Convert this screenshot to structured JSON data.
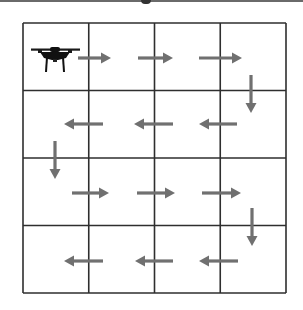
{
  "diagram": {
    "title": "",
    "type": "grid-path",
    "grid": {
      "rows": 4,
      "cols": 4,
      "x0": 23,
      "y0": 23,
      "x1": 286,
      "y1": 293,
      "line_color": "#2e2e2e"
    },
    "agent": {
      "icon": "drone-icon",
      "cell": [
        0,
        0
      ],
      "color": "#1a1a1a"
    },
    "arrow_color": "#707070",
    "path": [
      {
        "id": "r1-a1",
        "dir": "right",
        "x1": 78,
        "y1": 58,
        "x2": 111,
        "y2": 58
      },
      {
        "id": "r1-a2",
        "dir": "right",
        "x1": 138,
        "y1": 58,
        "x2": 173,
        "y2": 58
      },
      {
        "id": "r1-a3",
        "dir": "right",
        "x1": 199,
        "y1": 58,
        "x2": 242,
        "y2": 58
      },
      {
        "id": "d1",
        "dir": "down",
        "x1": 251,
        "y1": 75,
        "x2": 251,
        "y2": 113
      },
      {
        "id": "r2-a1",
        "dir": "left",
        "x1": 237,
        "y1": 124,
        "x2": 199,
        "y2": 124
      },
      {
        "id": "r2-a2",
        "dir": "left",
        "x1": 173,
        "y1": 124,
        "x2": 134,
        "y2": 124
      },
      {
        "id": "r2-a3",
        "dir": "left",
        "x1": 103,
        "y1": 124,
        "x2": 64,
        "y2": 124
      },
      {
        "id": "d2",
        "dir": "down",
        "x1": 55,
        "y1": 141,
        "x2": 55,
        "y2": 179
      },
      {
        "id": "r3-a1",
        "dir": "right",
        "x1": 72,
        "y1": 193,
        "x2": 109,
        "y2": 193
      },
      {
        "id": "r3-a2",
        "dir": "right",
        "x1": 137,
        "y1": 193,
        "x2": 175,
        "y2": 193
      },
      {
        "id": "r3-a3",
        "dir": "right",
        "x1": 202,
        "y1": 193,
        "x2": 241,
        "y2": 193
      },
      {
        "id": "d3",
        "dir": "down",
        "x1": 252,
        "y1": 208,
        "x2": 252,
        "y2": 246
      },
      {
        "id": "r4-a1",
        "dir": "left",
        "x1": 238,
        "y1": 261,
        "x2": 199,
        "y2": 261
      },
      {
        "id": "r4-a2",
        "dir": "left",
        "x1": 173,
        "y1": 261,
        "x2": 135,
        "y2": 261
      },
      {
        "id": "r4-a3",
        "dir": "left",
        "x1": 103,
        "y1": 261,
        "x2": 64,
        "y2": 261
      }
    ]
  }
}
